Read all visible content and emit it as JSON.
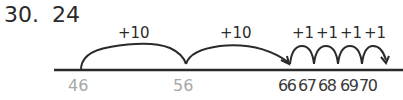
{
  "problem": {
    "number": "30.",
    "answer": "24"
  },
  "number_line": {
    "labels": [
      {
        "value": "46",
        "x": 81,
        "style": "gray"
      },
      {
        "value": "56",
        "x": 186,
        "style": "gray"
      },
      {
        "value": "66",
        "x": 289,
        "style": "dark"
      },
      {
        "value": "67",
        "x": 308,
        "style": "dark"
      },
      {
        "value": "68",
        "x": 327,
        "style": "dark"
      },
      {
        "value": "69",
        "x": 346,
        "style": "dark"
      },
      {
        "value": "70",
        "x": 366,
        "style": "dark"
      }
    ],
    "jumps": [
      {
        "label": "+10",
        "from": "46",
        "to": "56"
      },
      {
        "label": "+10",
        "from": "56",
        "to": "66"
      },
      {
        "label": "+1",
        "from": "66",
        "to": "67"
      },
      {
        "label": "+1",
        "from": "67",
        "to": "68"
      },
      {
        "label": "+1",
        "from": "68",
        "to": "69"
      },
      {
        "label": "+1",
        "from": "69",
        "to": "70"
      }
    ]
  },
  "colors": {
    "ink": "#2a2a2a",
    "start_labels": "#a8a8a8"
  }
}
